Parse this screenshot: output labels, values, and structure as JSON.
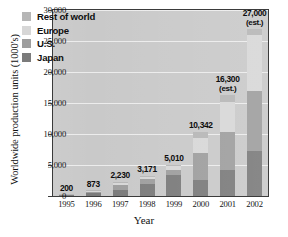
{
  "chart_data": {
    "type": "bar",
    "title": "",
    "xlabel": "Year",
    "ylabel": "Worldwide production units (1000's)",
    "categories": [
      "1995",
      "1996",
      "1997",
      "1998",
      "1999",
      "2000",
      "2001",
      "2002"
    ],
    "ylim": [
      0,
      30000
    ],
    "yticks": [
      "0",
      "5,000",
      "10,000",
      "15,000",
      "20,000",
      "25,000",
      "30,000"
    ],
    "ytick_values": [
      0,
      5000,
      10000,
      15000,
      20000,
      25000,
      30000
    ],
    "grid": true,
    "legend_position": "top-left-inside",
    "stacked": true,
    "totals": [
      200,
      873,
      2230,
      3171,
      5010,
      10342,
      16300,
      27000
    ],
    "total_labels": [
      "200",
      "873",
      "2,230",
      "3,171",
      "5,010",
      "10,342",
      "16,300",
      "27,000"
    ],
    "estimated_flags": [
      false,
      false,
      false,
      false,
      false,
      false,
      true,
      true
    ],
    "estimate_note": "(est.)",
    "series": [
      {
        "name": "Japan",
        "color": "#7b7b7b",
        "values": [
          150,
          520,
          1050,
          1950,
          3350,
          2650,
          4150,
          7200
        ]
      },
      {
        "name": "U.S.",
        "color": "#9e9e9e",
        "values": [
          40,
          220,
          760,
          830,
          900,
          4350,
          6100,
          9800
        ]
      },
      {
        "name": "Europe",
        "color": "#d7d7d7",
        "values": [
          8,
          93,
          300,
          290,
          560,
          2400,
          4900,
          9000
        ]
      },
      {
        "name": "Rest of world",
        "color": "#b6b6b6",
        "values": [
          2,
          40,
          120,
          101,
          200,
          942,
          1150,
          1000
        ]
      }
    ],
    "legend_entries": [
      "Rest of world",
      "Europe",
      "U.S.",
      "Japan"
    ]
  }
}
